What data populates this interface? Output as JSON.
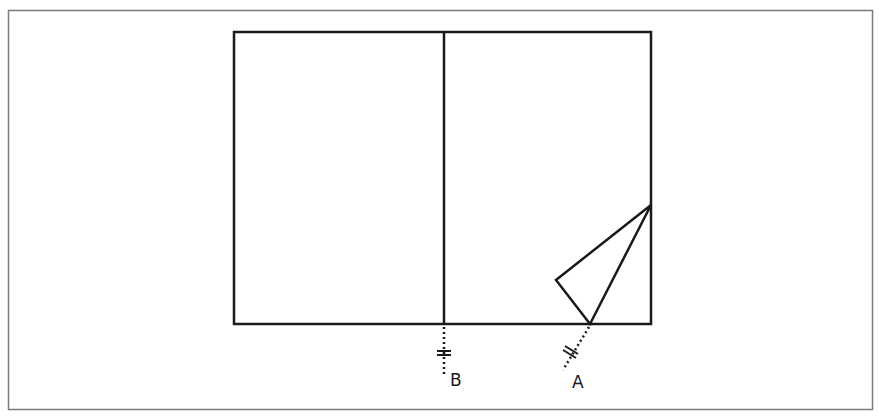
{
  "diagram": {
    "colors": {
      "frame": "#7a7a7a",
      "stroke": "#1a1a1a",
      "background": "#ffffff"
    },
    "frame": {
      "x": 8,
      "y": 10,
      "width": 865,
      "height": 400
    },
    "rectangle": {
      "x": 234,
      "y": 32,
      "width": 417,
      "height": 292
    },
    "divider": {
      "x": 444,
      "y1": 32,
      "y2": 324
    },
    "fold_triangle": {
      "points": [
        [
          651,
          205
        ],
        [
          556,
          280
        ],
        [
          590,
          324
        ]
      ]
    },
    "markers": [
      {
        "id": "B",
        "label": "B",
        "line": [
          [
            444,
            324
          ],
          [
            444,
            376
          ]
        ],
        "ticks_at": [
          444,
          353
        ],
        "label_pos": [
          450,
          386
        ]
      },
      {
        "id": "A",
        "label": "A",
        "line": [
          [
            590,
            324
          ],
          [
            564,
            369
          ]
        ],
        "ticks_at": [
          573,
          352
        ],
        "label_pos": [
          572,
          388
        ]
      }
    ]
  }
}
